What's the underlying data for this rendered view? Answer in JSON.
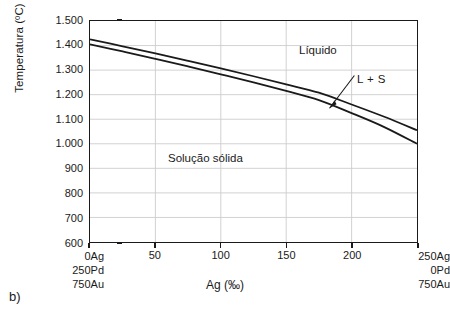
{
  "figure": {
    "label": "b)"
  },
  "chart_data": {
    "type": "line",
    "title": "",
    "xlabel": "Ag (‰)",
    "ylabel": "Temperatura (ºC)",
    "xlim": [
      0,
      250
    ],
    "ylim": [
      600,
      1500
    ],
    "grid": true,
    "legend_position": "none",
    "x_ticks": [
      0,
      50,
      100,
      150,
      200,
      250
    ],
    "x_tick_labels": [
      "0Ag",
      "50",
      "100",
      "150",
      "200",
      "250Ag"
    ],
    "y_ticks": [
      600,
      700,
      800,
      900,
      1000,
      1100,
      1200,
      1300,
      1400,
      1500
    ],
    "y_tick_labels": [
      "600",
      "700",
      "800",
      "900",
      "1.000",
      "1.100",
      "1.200",
      "1.300",
      "1.400",
      "1.500"
    ],
    "series": [
      {
        "name": "Liquidus",
        "x": [
          0,
          25,
          50,
          75,
          100,
          125,
          150,
          175,
          200,
          225,
          250
        ],
        "values": [
          1425,
          1397,
          1368,
          1338,
          1307,
          1275,
          1242,
          1208,
          1160,
          1110,
          1055
        ]
      },
      {
        "name": "Solidus",
        "x": [
          0,
          25,
          50,
          75,
          100,
          125,
          150,
          175,
          200,
          225,
          250
        ],
        "values": [
          1405,
          1376,
          1346,
          1315,
          1283,
          1250,
          1215,
          1178,
          1125,
          1068,
          1000
        ]
      }
    ],
    "annotations": [
      {
        "text": "Líquido",
        "x": 178,
        "y": 1375
      },
      {
        "text": "L + S",
        "x": 228,
        "y": 1255
      },
      {
        "text": "Solução sólida",
        "x": 88,
        "y": 920
      }
    ],
    "endmembers": {
      "left": [
        "0Ag",
        "250Pd",
        "750Au"
      ],
      "right": [
        "250Ag",
        "0Pd",
        "750Au"
      ]
    },
    "colors": {
      "curve": "#1a1a1a",
      "grid": "#cccccc",
      "axis": "#1a1a1a",
      "background": "#ffffff"
    }
  }
}
